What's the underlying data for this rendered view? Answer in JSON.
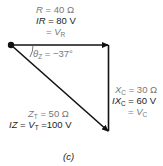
{
  "diagram": {
    "type": "phasor_triangle",
    "caption": "(c)",
    "resistor": {
      "line1_var": "R",
      "line1_rest": " = 40 Ω",
      "line2_var": "IR",
      "line2_rest": " = 80 V",
      "line3_prefix": "= ",
      "line3_var": "V",
      "line3_sub": "R"
    },
    "capacitor": {
      "line1_var": "X",
      "line1_sub": "C",
      "line1_rest": " = 30 Ω",
      "line2_var": "IX",
      "line2_sub": "C",
      "line2_rest": " = 60 V",
      "line3_prefix": "= ",
      "line3_var": "V",
      "line3_sub": "C"
    },
    "total": {
      "line1_var": "Z",
      "line1_sub": "T",
      "line1_rest": " = 50 Ω",
      "line2_var": "IZ",
      "line2_mid": " = ",
      "line2_var2": "V",
      "line2_sub": "T",
      "line2_rest": " =100 V"
    },
    "angle": {
      "var": "θ",
      "sub": "Z",
      "rest": " = −37°"
    },
    "colors": {
      "line": "#111111",
      "text_dark": "#222222",
      "text_gray": "#777777"
    }
  }
}
